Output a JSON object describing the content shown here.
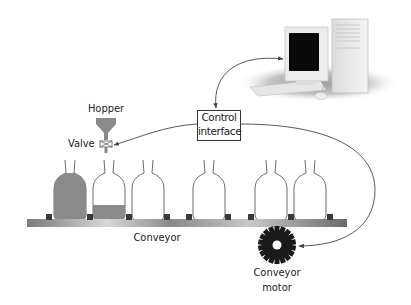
{
  "diagram": {
    "labels": {
      "hopper": "Hopper",
      "valve": "Valve",
      "control_line1": "Control",
      "control_line2": "interface",
      "conveyor": "Conveyor",
      "motor_line1": "Conveyor",
      "motor_line2": "motor"
    },
    "components": [
      {
        "id": "computer",
        "type": "desktop-computer"
      },
      {
        "id": "control-interface",
        "type": "box"
      },
      {
        "id": "hopper",
        "type": "funnel"
      },
      {
        "id": "valve",
        "type": "valve-symbol"
      },
      {
        "id": "conveyor",
        "type": "belt"
      },
      {
        "id": "conveyor-motor",
        "type": "gear"
      }
    ],
    "bottles": [
      {
        "index": 1,
        "fill": "full"
      },
      {
        "index": 2,
        "fill": "partial"
      },
      {
        "index": 3,
        "fill": "empty"
      },
      {
        "index": 4,
        "fill": "empty"
      },
      {
        "index": 5,
        "fill": "empty"
      },
      {
        "index": 6,
        "fill": "empty"
      }
    ],
    "connections": [
      {
        "from": "control-interface",
        "to": "computer",
        "bidirectional": true
      },
      {
        "from": "control-interface",
        "to": "valve",
        "bidirectional": false
      },
      {
        "from": "control-interface",
        "to": "conveyor-motor",
        "bidirectional": false
      }
    ],
    "colors": {
      "fill_gray": "#8a8a8a",
      "outline": "#555555",
      "gear": "#1a1a1a",
      "screen": "#0a0a0a",
      "line": "#444444"
    }
  }
}
